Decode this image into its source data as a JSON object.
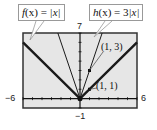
{
  "chart_data": {
    "type": "line",
    "title": "",
    "xlabel": "",
    "ylabel": "",
    "xlim": [
      -6,
      6
    ],
    "ylim": [
      -1,
      7
    ],
    "window_labels": {
      "xmin": "−6",
      "xmax": "6",
      "ymin": "−1",
      "ymax": "7"
    },
    "grid": false,
    "tick_marks": true,
    "series": [
      {
        "name": "f(x) = |x|",
        "expr": "abs(x)",
        "style": "thick",
        "points": [
          [
            -6,
            6
          ],
          [
            0,
            0
          ],
          [
            6,
            6
          ]
        ]
      },
      {
        "name": "h(x) = 3|x|",
        "expr": "3*abs(x)",
        "style": "thin",
        "points": [
          [
            -2.333,
            7
          ],
          [
            0,
            0
          ],
          [
            2.333,
            7
          ]
        ]
      }
    ],
    "annotations": [
      {
        "text": "(1, 3)",
        "x": 1,
        "y": 3
      },
      {
        "text": "(1, 1)",
        "x": 1,
        "y": 1
      }
    ],
    "legend": "callouts"
  },
  "labels": {
    "f_callout": {
      "name": "f",
      "arg": "(x)",
      "eq": " = ",
      "body": "|x|"
    },
    "h_callout": {
      "name": "h",
      "arg": "(x)",
      "eq": " = 3",
      "body": "|x|"
    },
    "point_13": "(1, 3)",
    "point_11": "(1, 1)",
    "xmin": "−6",
    "xmax": "6",
    "ymin": "−1",
    "ymax": "7"
  },
  "colors": {
    "plot_bg": "#e6e6e6",
    "frame": "#333333",
    "line": "#1a1a1a"
  }
}
